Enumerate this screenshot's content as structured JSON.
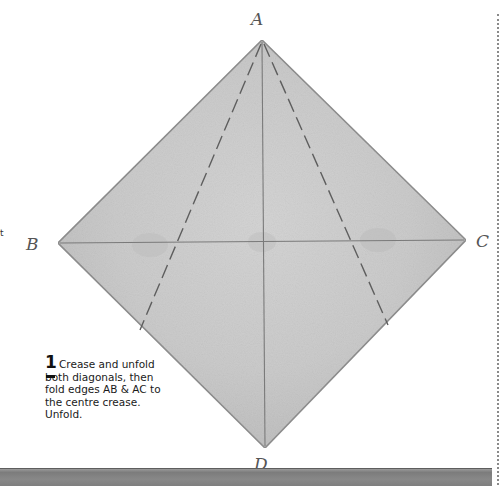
{
  "diagram": {
    "labels": {
      "a": "A",
      "b": "B",
      "c": "C",
      "d": "D"
    },
    "colors": {
      "paper": "#cfcfcf",
      "paper_edge": "#8f8f8f",
      "crease": "#7a7a7a",
      "dashed_fold": "#5e5e5e"
    }
  },
  "step": {
    "number": "1",
    "text": "Crease and unfold both diagonals, then fold edges AB & AC to the centre crease. Unfold."
  },
  "edge_fragment": "t"
}
